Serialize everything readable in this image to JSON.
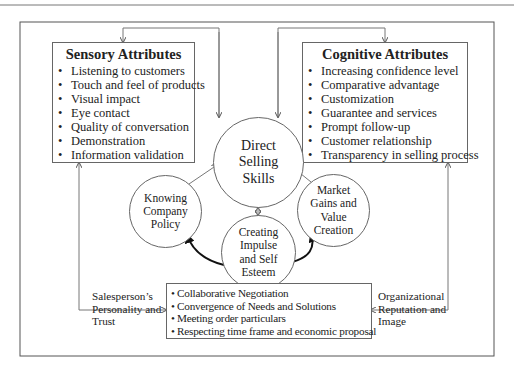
{
  "diagram": {
    "sensory": {
      "title": "Sensory Attributes",
      "items": [
        "Listening to customers",
        "Touch and feel of products",
        "Visual impact",
        "Eye contact",
        "Quality of conversation",
        "Demonstration",
        "Information validation"
      ]
    },
    "cognitive": {
      "title": "Cognitive Attributes",
      "items": [
        "Increasing confidence level",
        "Comparative advantage",
        "Customization",
        "Guarantee and services",
        "Prompt follow-up",
        "Customer relationship",
        "Transparency in selling process"
      ]
    },
    "center": {
      "lines": [
        "Direct",
        "Selling",
        "Skills"
      ]
    },
    "knowing": {
      "lines": [
        "Knowing",
        "Company",
        "Policy"
      ]
    },
    "impulse": {
      "lines": [
        "Creating",
        "Impulse",
        "and Self",
        "Esteem"
      ]
    },
    "market": {
      "lines": [
        "Market",
        "Gains and",
        "Value",
        "Creation"
      ]
    },
    "bottom": {
      "items": [
        "Collaborative Negotiation",
        "Convergence of  Needs and Solutions",
        "Meeting order  particulars",
        "Respecting time frame and economic proposal"
      ]
    },
    "left_label": {
      "lines": [
        "Salesperson’s",
        "Personality and",
        "Trust"
      ]
    },
    "right_label": {
      "lines": [
        "Organizational",
        "Reputation and",
        "Image"
      ]
    }
  },
  "colors": {
    "line": "#666666",
    "arrow_bold": "#111111",
    "text": "#222222"
  }
}
